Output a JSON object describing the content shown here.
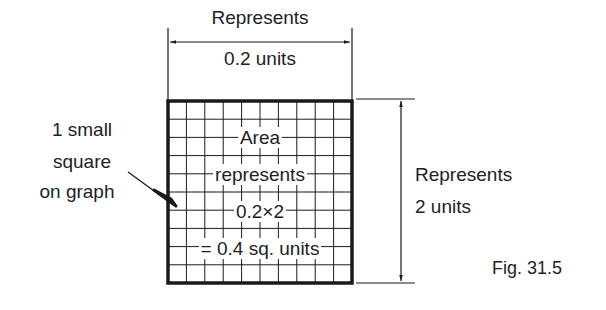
{
  "figure": {
    "caption": "Fig. 31.5",
    "top_dimension": {
      "line1": "Represents",
      "line2": "0.2 units"
    },
    "right_dimension": {
      "line1": "Represents",
      "line2": "2 units"
    },
    "left_callout": {
      "line1": "1 small",
      "line2": "square",
      "line3": "on graph"
    },
    "inner_text": {
      "line1": "Area",
      "line2": "represents",
      "line3": "0.2×2",
      "line4": "= 0.4 sq. units"
    },
    "grid": {
      "columns": 10,
      "rows": 10
    },
    "colors": {
      "ink": "#1a1a1a",
      "background": "#ffffff"
    }
  }
}
